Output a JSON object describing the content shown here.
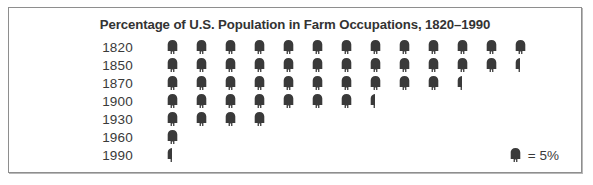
{
  "chart_data": {
    "type": "bar",
    "subtype": "pictogram",
    "title": "Percentage of U.S. Population in Farm Occupations, 1820–1990",
    "xlabel": "",
    "ylabel": "",
    "unit_label": "= 5%",
    "unit_value": 5,
    "icon_name": "person-icon",
    "icon_color": "#3a3a3a",
    "categories": [
      "1820",
      "1850",
      "1870",
      "1900",
      "1930",
      "1960",
      "1990"
    ],
    "values": [
      65,
      62.5,
      52.5,
      37.5,
      20,
      5,
      2.5
    ],
    "icon_counts": [
      13,
      12.5,
      10.5,
      7.5,
      4,
      1,
      0.5
    ],
    "rows": [
      {
        "label": "1820",
        "value": 65,
        "full_icons": 13,
        "half_icon": false
      },
      {
        "label": "1850",
        "value": 62.5,
        "full_icons": 12,
        "half_icon": true
      },
      {
        "label": "1870",
        "value": 52.5,
        "full_icons": 10,
        "half_icon": true
      },
      {
        "label": "1900",
        "value": 37.5,
        "full_icons": 7,
        "half_icon": true
      },
      {
        "label": "1930",
        "value": 20,
        "full_icons": 4,
        "half_icon": false
      },
      {
        "label": "1960",
        "value": 5,
        "full_icons": 1,
        "half_icon": false
      },
      {
        "label": "1990",
        "value": 2.5,
        "full_icons": 0,
        "half_icon": true
      }
    ],
    "grid": false,
    "legend_position": "bottom-right",
    "ylim": [
      0,
      65
    ]
  },
  "frame": {
    "border_color": "#8e8e8e",
    "background": "#ffffff"
  },
  "title": "Percentage of U.S. Population in Farm Occupations, 1820–1990",
  "legend": {
    "text": "= 5%"
  }
}
